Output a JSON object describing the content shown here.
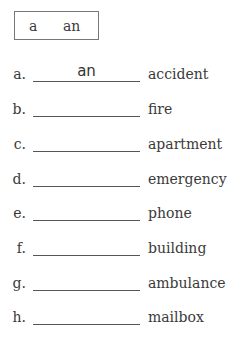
{
  "word_box": {
    "options": [
      "a",
      "an"
    ]
  },
  "items": [
    {
      "label": "a.",
      "answer": "an",
      "word": "accident"
    },
    {
      "label": "b.",
      "answer": "",
      "word": "fire"
    },
    {
      "label": "c.",
      "answer": "",
      "word": "apartment"
    },
    {
      "label": "d.",
      "answer": "",
      "word": "emergency"
    },
    {
      "label": "e.",
      "answer": "",
      "word": "phone"
    },
    {
      "label": "f.",
      "answer": "",
      "word": "building"
    },
    {
      "label": "g.",
      "answer": "",
      "word": "ambulance"
    },
    {
      "label": "h.",
      "answer": "",
      "word": "mailbox"
    }
  ]
}
